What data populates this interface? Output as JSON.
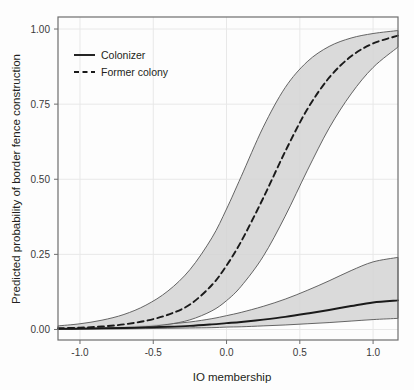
{
  "chart_data": {
    "type": "line",
    "title": "",
    "xlabel": "IO membership",
    "ylabel": "Predicted probability of border fence construction",
    "xlim": [
      -1.15,
      1.17
    ],
    "ylim": [
      -0.035,
      1.04
    ],
    "xticks": [
      -1.0,
      -0.5,
      0.0,
      0.5,
      1.0
    ],
    "xticklabels": [
      "-1.0",
      "-0.5",
      "0.0",
      "0.5",
      "1.0"
    ],
    "yticks": [
      0.0,
      0.25,
      0.5,
      0.75,
      1.0
    ],
    "yticklabels": [
      "0.00",
      "0.25",
      "0.50",
      "0.75",
      "1.00"
    ],
    "grid": true,
    "legend_position": "top-left",
    "frame": true,
    "background_color": "#fdfdfd",
    "band_color": "#d4d4d4",
    "line_color": "#1a1a1a",
    "grid_color": "#e8e8e8",
    "frame_color": "#6e6e6e",
    "series": [
      {
        "name": "Colonizer",
        "style": "solid",
        "x": [
          -1.15,
          -1.0,
          -0.85,
          -0.7,
          -0.55,
          -0.4,
          -0.25,
          -0.1,
          0.0,
          0.1,
          0.25,
          0.4,
          0.55,
          0.7,
          0.85,
          1.0,
          1.17
        ],
        "values": [
          0.002,
          0.003,
          0.004,
          0.005,
          0.007,
          0.009,
          0.012,
          0.017,
          0.021,
          0.025,
          0.033,
          0.042,
          0.053,
          0.065,
          0.078,
          0.09,
          0.097
        ],
        "ci_lower": [
          0.001,
          0.001,
          0.002,
          0.002,
          0.003,
          0.004,
          0.005,
          0.006,
          0.008,
          0.009,
          0.012,
          0.015,
          0.019,
          0.023,
          0.028,
          0.033,
          0.037
        ],
        "ci_upper": [
          0.004,
          0.005,
          0.007,
          0.009,
          0.013,
          0.018,
          0.025,
          0.036,
          0.046,
          0.057,
          0.077,
          0.101,
          0.13,
          0.162,
          0.196,
          0.225,
          0.24
        ]
      },
      {
        "name": "Former colony",
        "style": "dashed",
        "x": [
          -1.15,
          -1.0,
          -0.85,
          -0.7,
          -0.55,
          -0.4,
          -0.25,
          -0.1,
          0.0,
          0.1,
          0.25,
          0.4,
          0.55,
          0.7,
          0.85,
          1.0,
          1.17
        ],
        "values": [
          0.004,
          0.006,
          0.01,
          0.017,
          0.029,
          0.049,
          0.083,
          0.148,
          0.213,
          0.293,
          0.437,
          0.592,
          0.732,
          0.838,
          0.909,
          0.952,
          0.978
        ],
        "ci_lower": [
          0.001,
          0.002,
          0.003,
          0.005,
          0.009,
          0.017,
          0.032,
          0.062,
          0.096,
          0.144,
          0.243,
          0.377,
          0.528,
          0.67,
          0.784,
          0.872,
          0.94
        ],
        "ci_upper": [
          0.012,
          0.019,
          0.031,
          0.05,
          0.081,
          0.128,
          0.199,
          0.305,
          0.401,
          0.509,
          0.673,
          0.805,
          0.891,
          0.942,
          0.97,
          0.985,
          0.995
        ]
      }
    ],
    "legend": [
      {
        "label": "Colonizer",
        "style": "solid"
      },
      {
        "label": "Former colony",
        "style": "dashed"
      }
    ]
  }
}
